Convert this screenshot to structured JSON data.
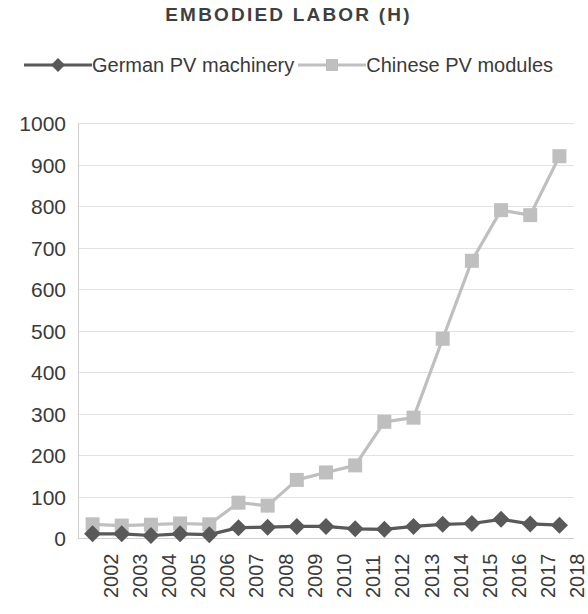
{
  "chart_data": {
    "type": "line",
    "title": "EMBODIED LABOR (H)",
    "xlabel": "",
    "ylabel": "",
    "ylim": [
      0,
      1000
    ],
    "y_ticks": [
      0,
      100,
      200,
      300,
      400,
      500,
      600,
      700,
      800,
      900,
      1000
    ],
    "grid": true,
    "legend_position": "top",
    "categories": [
      "2002",
      "2003",
      "2004",
      "2005",
      "2006",
      "2007",
      "2008",
      "2009",
      "2010",
      "2011",
      "2012",
      "2013",
      "2014",
      "2015",
      "2016",
      "2017",
      "2018"
    ],
    "series": [
      {
        "name": "German PV machinery",
        "marker": "diamond",
        "color": "#595959",
        "values": [
          10,
          10,
          6,
          10,
          8,
          25,
          26,
          28,
          28,
          22,
          21,
          28,
          33,
          35,
          45,
          34,
          31
        ]
      },
      {
        "name": "Chinese PV modules",
        "marker": "square",
        "color": "#bfbfbf",
        "values": [
          33,
          30,
          32,
          35,
          33,
          85,
          78,
          140,
          158,
          175,
          280,
          290,
          480,
          668,
          790,
          778,
          920
        ]
      }
    ]
  },
  "colors": {
    "background": "#ffffff",
    "text": "#3a3a3a",
    "gridline": "#e2e2e2",
    "axis": "#cfcfcf",
    "series_german": "#595959",
    "series_chinese": "#bfbfbf"
  }
}
